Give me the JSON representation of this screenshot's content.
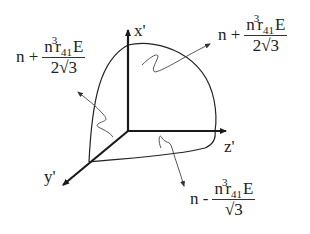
{
  "axes": {
    "x": {
      "label": "x'"
    },
    "y": {
      "label": "y'"
    },
    "z": {
      "label": "z'"
    }
  },
  "annotations": {
    "left": {
      "prefix": "n",
      "operator": "+",
      "numerator": {
        "base": "n",
        "exponent": "3",
        "coef": "r",
        "subscript": "41",
        "field": "E"
      },
      "denominator": {
        "coef": "2",
        "radical": "√3"
      }
    },
    "top_right": {
      "prefix": "n",
      "operator": "+",
      "numerator": {
        "base": "n",
        "exponent": "3",
        "coef": "r",
        "subscript": "41",
        "field": "E"
      },
      "denominator": {
        "coef": "2",
        "radical": "√3"
      }
    },
    "bottom": {
      "prefix": "n",
      "operator": "-",
      "numerator": {
        "base": "n",
        "exponent": "3",
        "coef": "r",
        "subscript": "41",
        "field": "E"
      },
      "denominator": {
        "coef": "",
        "radical": "√3"
      }
    }
  },
  "colors": {
    "ink": "#222222",
    "axis": "#1a1a1a",
    "thin": "#555555"
  }
}
